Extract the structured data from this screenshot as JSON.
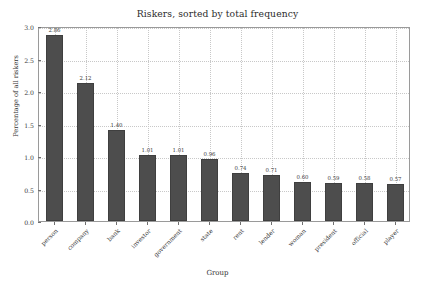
{
  "chart_data": {
    "type": "bar",
    "title": "Riskers, sorted by total frequency",
    "xlabel": "Group",
    "ylabel": "Percentage of all riskers",
    "categories": [
      "person",
      "company",
      "bank",
      "investor",
      "government",
      "state",
      "rent",
      "lender",
      "woman",
      "president",
      "official",
      "player"
    ],
    "values": [
      2.86,
      2.12,
      1.4,
      1.01,
      1.01,
      0.96,
      0.74,
      0.71,
      0.6,
      0.59,
      0.58,
      0.57
    ],
    "value_labels": [
      "2.86",
      "2.12",
      "1.40",
      "1.01",
      "1.01",
      "0.96",
      "0.74",
      "0.71",
      "0.60",
      "0.59",
      "0.58",
      "0.57"
    ],
    "ylim": [
      0.0,
      3.0
    ],
    "yticks": [
      0.0,
      0.5,
      1.0,
      1.5,
      2.0,
      2.5,
      3.0
    ],
    "ytick_labels": [
      "0.0",
      "0.5",
      "1.0",
      "1.5",
      "2.0",
      "2.5",
      "3.0"
    ],
    "grid": true,
    "grid_style": "dotted",
    "legend": null,
    "bar_color": "#4d4d4d",
    "bar_edge_color": "#3f3f3f",
    "background_color": "#ffffff",
    "axis_color": "#9a9a9a",
    "xtick_rotation": -45
  }
}
